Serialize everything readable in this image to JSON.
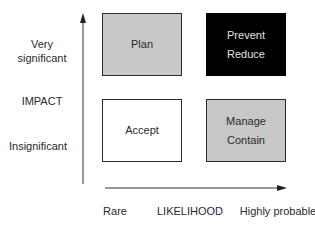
{
  "y_axis": {
    "title": "IMPACT",
    "high_label_line1": "Very",
    "high_label_line2": "significant",
    "low_label": "Insignificant"
  },
  "x_axis": {
    "title": "LIKELIHOOD",
    "low_label": "Rare",
    "high_label": "Highly probable"
  },
  "quadrants": {
    "high_impact_low_likelihood": {
      "line1": "Plan",
      "fill": "#c8c8c8"
    },
    "high_impact_high_likelihood": {
      "line1": "Prevent",
      "line2": "Reduce",
      "fill": "#000000"
    },
    "low_impact_low_likelihood": {
      "line1": "Accept",
      "fill": "#ffffff"
    },
    "low_impact_high_likelihood": {
      "line1": "Manage",
      "line2": "Contain",
      "fill": "#c8c8c8"
    }
  }
}
